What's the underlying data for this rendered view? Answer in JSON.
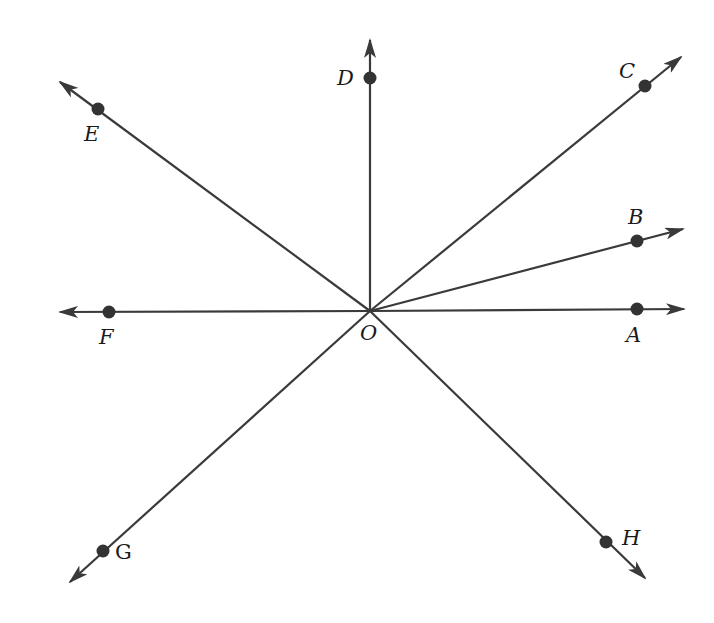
{
  "diagram": {
    "title": "",
    "type": "rays from common vertex",
    "origin": {
      "label": "O",
      "x": 370,
      "y": 311
    },
    "rays": [
      {
        "name": "ray-OA",
        "point": "A",
        "end": {
          "x": 684,
          "y": 311
        },
        "point_pos": {
          "x": 637,
          "y": 308
        }
      },
      {
        "name": "ray-OB",
        "point": "B",
        "end": {
          "x": 683,
          "y": 229
        },
        "point_pos": {
          "x": 637,
          "y": 241
        }
      },
      {
        "name": "ray-OC",
        "point": "C",
        "end": {
          "x": 681,
          "y": 57
        },
        "point_pos": {
          "x": 645,
          "y": 86
        }
      },
      {
        "name": "ray-OD",
        "point": "D",
        "end": {
          "x": 370,
          "y": 40
        },
        "point_pos": {
          "x": 370,
          "y": 78
        }
      },
      {
        "name": "ray-OE",
        "point": "E",
        "end": {
          "x": 60,
          "y": 82
        },
        "point_pos": {
          "x": 98,
          "y": 109
        }
      },
      {
        "name": "ray-OF",
        "point": "F",
        "end": {
          "x": 60,
          "y": 312
        },
        "point_pos": {
          "x": 109,
          "y": 312
        }
      },
      {
        "name": "ray-OG",
        "point": "G",
        "end": {
          "x": 70,
          "y": 582
        },
        "point_pos": {
          "x": 103,
          "y": 551
        }
      },
      {
        "name": "ray-OH",
        "point": "H",
        "end": {
          "x": 645,
          "y": 578
        },
        "point_pos": {
          "x": 606,
          "y": 542
        }
      }
    ],
    "labels": {
      "O": "O",
      "A": "A",
      "B": "B",
      "C": "C",
      "D": "D",
      "E": "E",
      "F": "F",
      "G": "G",
      "H": "H"
    },
    "colors": {
      "line": "#3a3a3a",
      "point": "#333333",
      "text": "#1a1a1a",
      "background": "#ffffff"
    }
  }
}
